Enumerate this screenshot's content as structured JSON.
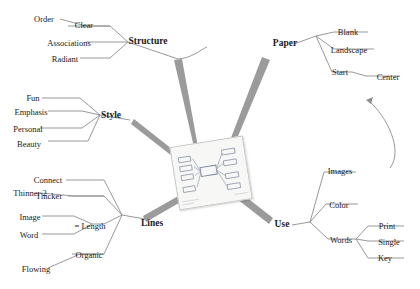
{
  "diagram": {
    "type": "mind-map",
    "center": {
      "label": "mind-map-thumbnail",
      "description": "small rotated photo of a hand-drawn mind map"
    },
    "branches": [
      {
        "name": "Structure",
        "label": "Structure",
        "leaves": [
          {
            "label": "Order",
            "children": []
          },
          {
            "label": "Clear",
            "children": []
          },
          {
            "label": "Associations",
            "children": []
          },
          {
            "label": "Radiant",
            "children": []
          }
        ]
      },
      {
        "name": "Style",
        "label": "Style",
        "leaves": [
          {
            "label": "Fun",
            "children": []
          },
          {
            "label": "Emphasis",
            "children": []
          },
          {
            "label": "Personal",
            "children": []
          },
          {
            "label": "Beauty",
            "children": []
          }
        ]
      },
      {
        "name": "Lines",
        "label": "Lines",
        "leaves": [
          {
            "label": "Connect",
            "children": []
          },
          {
            "label": "Thicker",
            "children": []
          },
          {
            "label": "Thinner 2",
            "children": []
          },
          {
            "label": "= Length",
            "children": [
              "Image",
              "Word"
            ]
          },
          {
            "label": "Organic",
            "children": []
          },
          {
            "label": "Flowing",
            "children": []
          }
        ]
      },
      {
        "name": "Paper",
        "label": "Paper",
        "leaves": [
          {
            "label": "Blank",
            "children": []
          },
          {
            "label": "Landscape",
            "children": []
          },
          {
            "label": "Start",
            "children": [
              "Center"
            ]
          }
        ]
      },
      {
        "name": "Use",
        "label": "Use",
        "leaves": [
          {
            "label": "Images",
            "children": []
          },
          {
            "label": "Color",
            "children": []
          },
          {
            "label": "Words",
            "children": [
              "Print",
              "Single",
              "Key"
            ]
          }
        ]
      }
    ],
    "labels": {
      "order": "Order",
      "clear": "Clear",
      "associations": "Associations",
      "radiant": "Radiant",
      "structure": "Structure",
      "fun": "Fun",
      "emphasis": "Emphasis",
      "personal": "Personal",
      "beauty": "Beauty",
      "style": "Style",
      "connect": "Connect",
      "thicker": "Thicker",
      "thinner2": "Thinner 2",
      "image": "Image",
      "word": "Word",
      "equals_length": "= Length",
      "organic": "Organic",
      "flowing": "Flowing",
      "lines": "Lines",
      "paper": "Paper",
      "blank": "Blank",
      "landscape": "Landscape",
      "start": "Start",
      "center": "Center",
      "use": "Use",
      "images": "Images",
      "color": "Color",
      "words": "Words",
      "print": "Print",
      "single": "Single",
      "key": "Key"
    },
    "colors": {
      "branch_stroke": "#9a9a9a",
      "leaf_stroke": "#8c8c8c",
      "text": "#1a1a1a",
      "background": "#ffffff",
      "card_border": "#c8c8c8"
    }
  }
}
